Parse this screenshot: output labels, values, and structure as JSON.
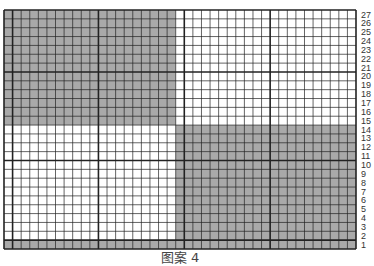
{
  "chart_data": {
    "type": "grid-pattern",
    "title": "图案 4",
    "columns": 41,
    "rows": 27,
    "row_labels": [
      "27",
      "26",
      "25",
      "24",
      "23",
      "22",
      "21",
      "20",
      "19",
      "18",
      "17",
      "16",
      "15",
      "14",
      "13",
      "12",
      "11",
      "10",
      "9",
      "8",
      "7",
      "6",
      "5",
      "4",
      "3",
      "2",
      "1"
    ],
    "shaded_regions": [
      {
        "name": "top-left-block",
        "col_start": 1,
        "col_end": 20,
        "row_top": 27,
        "row_bottom": 15
      },
      {
        "name": "bottom-right-block",
        "col_start": 21,
        "col_end": 41,
        "row_top": 14,
        "row_bottom": 1
      },
      {
        "name": "bottom-row",
        "col_start": 1,
        "col_end": 41,
        "row_top": 1,
        "row_bottom": 1
      }
    ],
    "thick_vertical_after_columns": [
      1,
      11,
      21,
      31
    ],
    "thick_horizontal_above_rows": [
      20,
      10,
      1
    ],
    "shade_color": "#a9a9a9",
    "line_color": "#222222",
    "background_color": "#ffffff"
  },
  "caption": "图案 4"
}
